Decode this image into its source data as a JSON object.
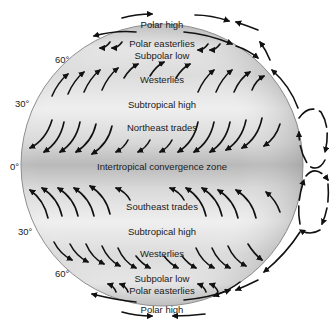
{
  "diagram": {
    "latitude_labels": [
      {
        "text": "60°",
        "x": 55,
        "y": 63
      },
      {
        "text": "30°",
        "x": 15,
        "y": 107
      },
      {
        "text": "0°",
        "x": 10,
        "y": 170
      },
      {
        "text": "30°",
        "x": 18,
        "y": 235
      },
      {
        "text": "60°",
        "x": 55,
        "y": 277
      }
    ],
    "zone_labels": [
      {
        "text": "Polar high",
        "x": 162,
        "y": 28
      },
      {
        "text": "Polar easterlies",
        "x": 162,
        "y": 47
      },
      {
        "text": "Subpolar low",
        "x": 162,
        "y": 59
      },
      {
        "text": "Westerlies",
        "x": 162,
        "y": 83
      },
      {
        "text": "Subtropical high",
        "x": 162,
        "y": 108
      },
      {
        "text": "Northeast trades",
        "x": 162,
        "y": 131
      },
      {
        "text": "Intertropical convergence zone",
        "x": 162,
        "y": 170
      },
      {
        "text": "Southeast trades",
        "x": 162,
        "y": 210
      },
      {
        "text": "Subtropical high",
        "x": 162,
        "y": 235
      },
      {
        "text": "Westerlies",
        "x": 162,
        "y": 257
      },
      {
        "text": "Subpolar low",
        "x": 162,
        "y": 282
      },
      {
        "text": "Polar easterlies",
        "x": 162,
        "y": 294
      },
      {
        "text": "Polar high",
        "x": 162,
        "y": 313
      }
    ],
    "colors": {
      "globe_edge": "#8a8a8a",
      "globe_light": "#f2f2f2",
      "globe_dark": "#b8b8b8",
      "arrow": "#111111"
    }
  }
}
